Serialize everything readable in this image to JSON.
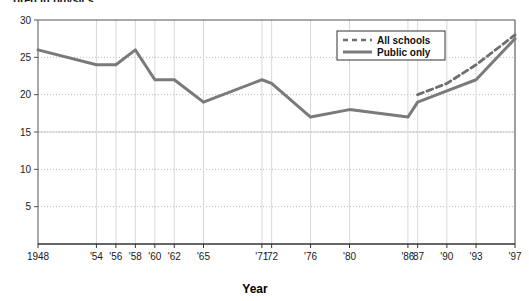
{
  "title_clipped": "...ored in physics",
  "axis": {
    "x_title": "Year",
    "y_title": ""
  },
  "legend": {
    "items": [
      {
        "label": "All schools",
        "style": "dashed",
        "color": "#6e6e6e"
      },
      {
        "label": "Public only",
        "style": "solid",
        "color": "#7a7a7a"
      }
    ]
  },
  "chart_data": {
    "type": "line",
    "title": "...ored in physics",
    "xlabel": "Year",
    "ylabel": "",
    "ylim": [
      0,
      30
    ],
    "yticks": [
      5,
      10,
      15,
      20,
      25,
      30
    ],
    "grid": {
      "horizontal": "dotted",
      "vertical": "solid-light"
    },
    "legend_position": "top-right",
    "x": [
      1948,
      1954,
      1956,
      1958,
      1960,
      1962,
      1965,
      1971,
      1972,
      1976,
      1980,
      1986,
      1987,
      1990,
      1993,
      1997
    ],
    "tick_labels": [
      "1948",
      "'54",
      "'56",
      "'58",
      "'60",
      "'62",
      "'65",
      "'71",
      "'72",
      "'76",
      "'80",
      "'86",
      "'87",
      "'90",
      "'93",
      "'97"
    ],
    "series": [
      {
        "name": "Public only",
        "style": "solid",
        "color": "#7a7a7a",
        "x": [
          1948,
          1954,
          1956,
          1958,
          1960,
          1962,
          1965,
          1971,
          1972,
          1976,
          1980,
          1986,
          1987,
          1990,
          1993,
          1997
        ],
        "values": [
          26,
          24,
          24,
          26,
          22,
          22,
          19,
          22,
          21.5,
          17,
          18,
          17,
          19,
          20.5,
          22,
          27.5
        ]
      },
      {
        "name": "All schools",
        "style": "dashed",
        "color": "#6e6e6e",
        "x": [
          1987,
          1990,
          1993,
          1997
        ],
        "values": [
          20,
          21.5,
          24,
          28
        ]
      }
    ]
  }
}
